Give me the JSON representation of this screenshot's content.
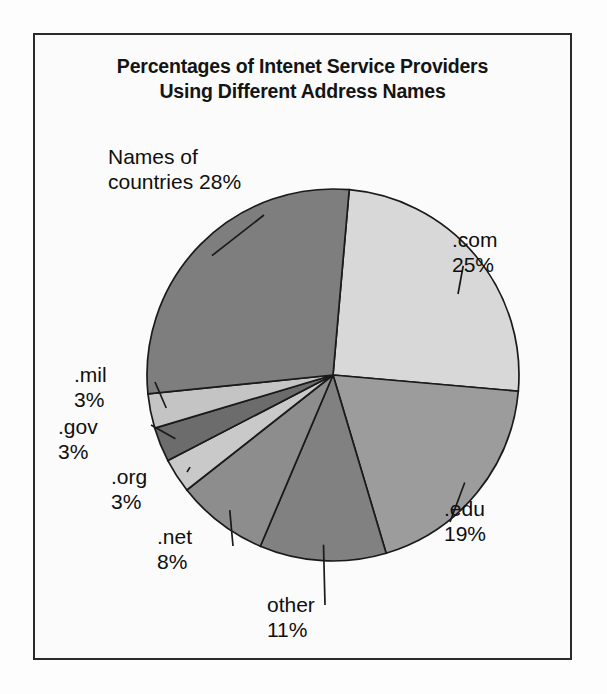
{
  "figure": {
    "title_line_1": "Percentages of Intenet Service Providers",
    "title_line_2": "Using Different Address Names"
  },
  "chart_data": {
    "type": "pie",
    "title": "Percentages of Intenet Service Providers Using Different Address Names",
    "xlabel": "",
    "ylabel": "",
    "units": "percent",
    "total": 100,
    "legend_position": "none",
    "labels_position": "callout-outside",
    "grid": false,
    "categories": [
      ".com",
      ".edu",
      "other",
      ".net",
      ".org",
      ".gov",
      ".mil",
      "Names of countries"
    ],
    "values": [
      25,
      19,
      11,
      8,
      3,
      3,
      3,
      28
    ],
    "slices": [
      {
        "name": ".com",
        "label": ".com",
        "value": 25,
        "value_text": "25%",
        "color": "#d8d8d8"
      },
      {
        "name": ".edu",
        "label": ".edu",
        "value": 19,
        "value_text": "19%",
        "color": "#9c9c9c"
      },
      {
        "name": "other",
        "label": "other",
        "value": 11,
        "value_text": "11%",
        "color": "#818181"
      },
      {
        "name": ".net",
        "label": ".net",
        "value": 8,
        "value_text": "8%",
        "color": "#8d8d8d"
      },
      {
        "name": ".org",
        "label": ".org",
        "value": 3,
        "value_text": "3%",
        "color": "#c9c9c9"
      },
      {
        "name": ".gov",
        "label": ".gov",
        "value": 3,
        "value_text": "3%",
        "color": "#6c6c6c"
      },
      {
        "name": ".mil",
        "label": ".mil",
        "value": 3,
        "value_text": "3%",
        "color": "#c4c4c4"
      },
      {
        "name": "Names of countries",
        "label": "Names of countries",
        "value": 28,
        "value_text": "28%",
        "color": "#7e7e7e"
      }
    ]
  },
  "labels": {
    "countries": {
      "line_1": "Names of",
      "line_2": "countries 28%"
    },
    "com": {
      "line_1": ".com",
      "line_2": "25%"
    },
    "edu": {
      "line_1": ".edu",
      "line_2": "19%"
    },
    "other": {
      "line_1": "other",
      "line_2": "11%"
    },
    "net": {
      "line_1": ".net",
      "line_2": "8%"
    },
    "org": {
      "line_1": ".org",
      "line_2": "3%"
    },
    "gov": {
      "line_1": ".gov",
      "line_2": "3%"
    },
    "mil": {
      "line_1": ".mil",
      "line_2": "3%"
    }
  },
  "style": {
    "frame_color": "#2a2a2a",
    "slice_outline_color": "#1a1a1a",
    "text_color": "#0f0f0f",
    "background": "#fbfbfb"
  }
}
